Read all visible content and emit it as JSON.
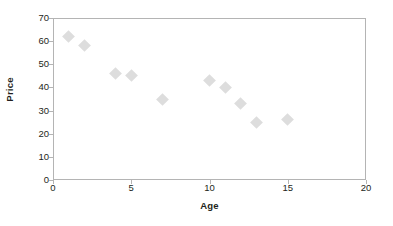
{
  "chart_data": {
    "type": "scatter",
    "title": "",
    "xlabel": "Age",
    "ylabel": "Price",
    "xlim": [
      0,
      20
    ],
    "ylim": [
      0,
      70
    ],
    "xticks": [
      0,
      5,
      10,
      15,
      20
    ],
    "yticks": [
      0,
      10,
      20,
      30,
      40,
      50,
      60,
      70
    ],
    "xtick_labels": [
      "0",
      "5",
      "10",
      "15",
      "20"
    ],
    "ytick_labels": [
      "0",
      "10",
      "20",
      "30",
      "40",
      "50",
      "60",
      "70"
    ],
    "grid": false,
    "legend": false,
    "series": [
      {
        "name": "Price vs Age",
        "marker": "diamond",
        "color": "#dddddd",
        "points": [
          {
            "x": 1,
            "y": 62
          },
          {
            "x": 2,
            "y": 58
          },
          {
            "x": 4,
            "y": 46
          },
          {
            "x": 5,
            "y": 45
          },
          {
            "x": 7,
            "y": 35
          },
          {
            "x": 10,
            "y": 43
          },
          {
            "x": 11,
            "y": 40
          },
          {
            "x": 12,
            "y": 33
          },
          {
            "x": 13,
            "y": 25
          },
          {
            "x": 15,
            "y": 26
          }
        ]
      }
    ]
  },
  "style": {
    "frame_color": "#b4b4b4",
    "marker_color": "#dddddd",
    "text_color": "#231f20",
    "background": "#ffffff"
  }
}
